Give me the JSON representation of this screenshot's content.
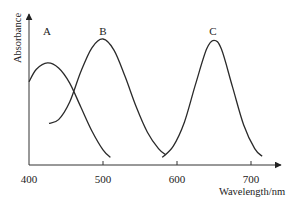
{
  "chart_data": {
    "type": "line",
    "title": "",
    "xlabel": "Wavelength/nm",
    "ylabel": "Absorbance",
    "xlim": [
      400,
      720
    ],
    "ylim": [
      0,
      1.2
    ],
    "x_ticks": [
      400,
      500,
      600,
      700
    ],
    "y_ticks": [],
    "grid": false,
    "legend": "none (curves labeled directly above peaks)",
    "series": [
      {
        "name": "A",
        "peak_wavelength": 425,
        "x": [
          400,
          410,
          425,
          440,
          455,
          470,
          485,
          500,
          510
        ],
        "values": [
          0.66,
          0.76,
          0.81,
          0.77,
          0.65,
          0.46,
          0.27,
          0.12,
          0.06
        ]
      },
      {
        "name": "B",
        "peak_wavelength": 500,
        "x": [
          427,
          440,
          455,
          470,
          485,
          500,
          515,
          530,
          545,
          560,
          575,
          585
        ],
        "values": [
          0.33,
          0.36,
          0.5,
          0.74,
          0.93,
          1.0,
          0.91,
          0.7,
          0.46,
          0.26,
          0.13,
          0.08
        ]
      },
      {
        "name": "C",
        "peak_wavelength": 650,
        "x": [
          580,
          595,
          610,
          625,
          640,
          650,
          660,
          675,
          690,
          705,
          715
        ],
        "values": [
          0.06,
          0.15,
          0.34,
          0.64,
          0.92,
          0.99,
          0.92,
          0.62,
          0.32,
          0.13,
          0.07
        ]
      }
    ],
    "annotations": [
      "A",
      "B",
      "C"
    ]
  }
}
